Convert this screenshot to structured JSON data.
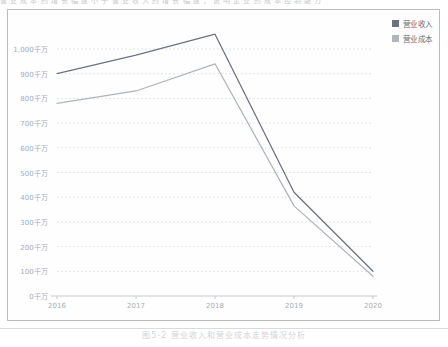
{
  "page": {
    "top_cut_text": "营 业 成 本 的 增 长 幅 度 小 于 营 业 收 入 的 增 长 幅 度 ， 说 明 企 业 的 成 本 控 制 能 力",
    "caption": "图5-2  营业收入和营业成本走势情况分析"
  },
  "legend": {
    "position": "top-right",
    "items": [
      {
        "label": "营业收入",
        "color": "#6b7280"
      },
      {
        "label": "营业成本",
        "color": "#b0b4bb"
      }
    ]
  },
  "axis": {
    "y_tick_labels": [
      "1,000千万",
      "900千万",
      "800千万",
      "700千万",
      "600千万",
      "500千万",
      "400千万",
      "300千万",
      "200千万",
      "100千万",
      "0千万"
    ],
    "y_tick_values": [
      1000,
      900,
      800,
      700,
      600,
      500,
      400,
      300,
      200,
      100,
      0
    ],
    "x_tick_labels": [
      "2016",
      "2017",
      "2018",
      "2019",
      "2020"
    ],
    "unit": "千万"
  },
  "colors": {
    "revenue_line": "#6b7280",
    "cost_line": "#b0b4bb",
    "gridline": "#dcdee2",
    "axis_line": "#c6c9cf",
    "frame_border": "#b9bcc4",
    "tick_text": "#a8abb2",
    "legend_text": "#6a6d74"
  },
  "chart_data": {
    "type": "line",
    "title": "",
    "subtitle": "",
    "xlabel": "",
    "ylabel": "",
    "categories": [
      "2016",
      "2017",
      "2018",
      "2019",
      "2020"
    ],
    "ylim": [
      0,
      1000
    ],
    "ytick_step": 100,
    "grid": true,
    "legend_position": "top-right",
    "series": [
      {
        "name": "营业收入",
        "color": "#6b7280",
        "values": [
          900,
          975,
          1060,
          420,
          100
        ]
      },
      {
        "name": "营业成本",
        "color": "#b0b4bb",
        "values": [
          780,
          830,
          940,
          365,
          80
        ]
      }
    ],
    "annotations": []
  }
}
